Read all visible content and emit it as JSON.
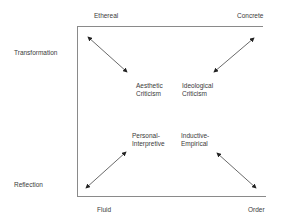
{
  "diagram": {
    "axis_labels": {
      "top_left": "Ethereal",
      "top_right": "Concrete",
      "bottom_left": "Fluid",
      "bottom_right": "Order",
      "left_top": "Transformation",
      "left_bottom": "Reflection"
    },
    "quadrants": {
      "top_left": {
        "line1": "Aesthetic",
        "line2": "Criticism"
      },
      "top_right": {
        "line1": "Ideological",
        "line2": "Criticism"
      },
      "bottom_left": {
        "line1": "Personal-",
        "line2": "Interpretive"
      },
      "bottom_right": {
        "line1": "Inductive-",
        "line2": "Empirical"
      }
    },
    "colors": {
      "line": "#8a8a8a",
      "arrow": "#333333"
    }
  }
}
